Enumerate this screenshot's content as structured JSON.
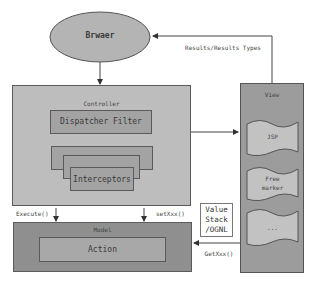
{
  "diagram": {
    "browser": {
      "label": "Brwaer"
    },
    "results_label": "Results/Results Types",
    "controller": {
      "label": "Controller",
      "dispatcher_filter": "Dispatcher Filter",
      "interceptors": "Interceptors"
    },
    "view": {
      "label": "View",
      "documents": [
        {
          "label": "JSP"
        },
        {
          "label": "Free\nmarker"
        },
        {
          "label": "..."
        }
      ]
    },
    "model": {
      "label": "Model",
      "action": "Action"
    },
    "value_stack": "Value\nStack\n/OGNL",
    "arrows": {
      "execute": "Execute()",
      "setxxx": "setXxx()",
      "getxxx": "GetXxx()"
    },
    "colors": {
      "ellipse_fill": "#b4b4b4",
      "controller_fill": "#bdbdbd",
      "inner_fill": "#a3a3a3",
      "view_fill": "#9c9c9c",
      "doc_fill": "#c2c2c2",
      "model_fill": "#8f8f8f",
      "action_fill": "#a8a8a8",
      "line": "#5a5a5a"
    }
  }
}
